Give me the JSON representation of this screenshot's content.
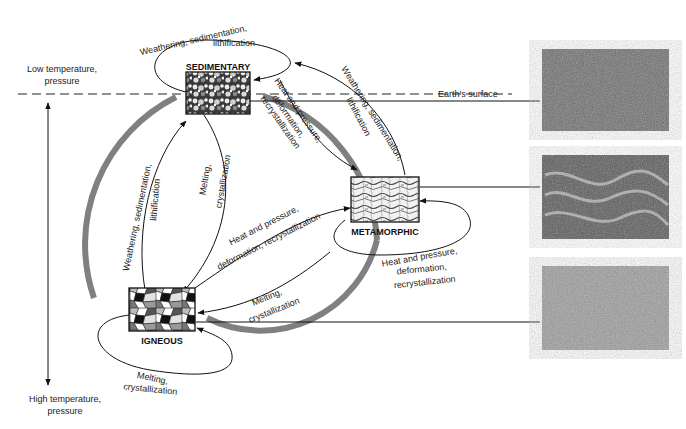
{
  "diagram": {
    "type": "rock-cycle",
    "axis": {
      "top_label_line1": "Low temperature,",
      "top_label_line2": "pressure",
      "bottom_label_line1": "High temperature,",
      "bottom_label_line2": "pressure"
    },
    "surface_label": "Earth's surface",
    "rocks": {
      "sedimentary": "SEDIMENTARY",
      "metamorphic": "METAMORPHIC",
      "igneous": "IGNEOUS"
    },
    "processes": {
      "sed_loop_line1": "Weathering, sedimentation,",
      "sed_loop_line2": "lithification",
      "sed_to_meta_line1": "Heat and pressure,",
      "sed_to_meta_line2": "deformation,",
      "sed_to_meta_line3": "recrystallization",
      "meta_to_sed_line1": "Weathering, sedimentation,",
      "meta_to_sed_line2": "lithification",
      "ign_to_sed_line1": "Weathering, sedimentation,",
      "ign_to_sed_line2": "lithification",
      "sed_to_ign_line1": "Melting,",
      "sed_to_ign_line2": "crystallization",
      "ign_to_meta_line1": "Heat and pressure,",
      "ign_to_meta_line2": "deformation, recrystallization",
      "meta_loop_line1": "Heat and pressure,",
      "meta_loop_line2": "deformation,",
      "meta_loop_line3": "recrystallization",
      "meta_to_ign_line1": "Melting,",
      "meta_to_ign_line2": "crystallization",
      "ign_loop_line1": "Melting,",
      "ign_loop_line2": "crystallization"
    },
    "photos": [
      {
        "name": "sedimentary-rock-photo"
      },
      {
        "name": "metamorphic-rock-photo"
      },
      {
        "name": "igneous-rock-photo"
      }
    ],
    "colors": {
      "cycle_band": "#808080",
      "line": "#111111",
      "background": "#ffffff"
    }
  }
}
